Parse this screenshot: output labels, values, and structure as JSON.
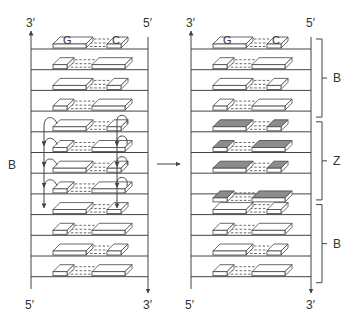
{
  "colors": {
    "line": "#444444",
    "block_fill": "#ffffff",
    "z_fill": "#8c8c8c",
    "text": "#333333"
  },
  "left_panel": {
    "top_left_label": "3′",
    "top_right_label": "5′",
    "bottom_left_label": "5′",
    "bottom_right_label": "3′",
    "side_label": "B",
    "first_pair": {
      "left_base": "G",
      "right_base": "C"
    },
    "rows": [
      {
        "pattern": "long-short",
        "form": "B",
        "flip_arrows": false
      },
      {
        "pattern": "short-long",
        "form": "B",
        "flip_arrows": false
      },
      {
        "pattern": "long-short",
        "form": "B",
        "flip_arrows": false
      },
      {
        "pattern": "short-long",
        "form": "B",
        "flip_arrows": false
      },
      {
        "pattern": "long-short",
        "form": "B",
        "flip_arrows": true
      },
      {
        "pattern": "short-long",
        "form": "B",
        "flip_arrows": true
      },
      {
        "pattern": "long-short",
        "form": "B",
        "flip_arrows": true
      },
      {
        "pattern": "short-long",
        "form": "B",
        "flip_arrows": true
      },
      {
        "pattern": "long-short",
        "form": "B",
        "flip_arrows": false
      },
      {
        "pattern": "short-long",
        "form": "B",
        "flip_arrows": false
      },
      {
        "pattern": "long-short",
        "form": "B",
        "flip_arrows": false
      },
      {
        "pattern": "short-long",
        "form": "B",
        "flip_arrows": false
      }
    ]
  },
  "transition_arrow": "→",
  "right_panel": {
    "top_left_label": "3′",
    "top_right_label": "5′",
    "bottom_left_label": "5′",
    "bottom_right_label": "3′",
    "first_pair": {
      "left_base": "G",
      "right_base": "C"
    },
    "rows": [
      {
        "pattern": "long-short",
        "form": "B"
      },
      {
        "pattern": "short-long",
        "form": "B"
      },
      {
        "pattern": "long-short",
        "form": "B"
      },
      {
        "pattern": "short-long",
        "form": "B"
      },
      {
        "pattern": "long-short",
        "form": "Z"
      },
      {
        "pattern": "short-long",
        "form": "Z"
      },
      {
        "pattern": "long-short",
        "form": "Z"
      },
      {
        "pattern": "short-long",
        "form": "Z"
      },
      {
        "pattern": "long-short",
        "form": "B"
      },
      {
        "pattern": "short-long",
        "form": "B"
      },
      {
        "pattern": "long-short",
        "form": "B"
      },
      {
        "pattern": "short-long",
        "form": "B"
      }
    ],
    "brackets": [
      {
        "label": "B",
        "from_row": 0,
        "to_row": 3
      },
      {
        "label": "Z",
        "from_row": 4,
        "to_row": 7
      },
      {
        "label": "B",
        "from_row": 8,
        "to_row": 11
      }
    ]
  }
}
